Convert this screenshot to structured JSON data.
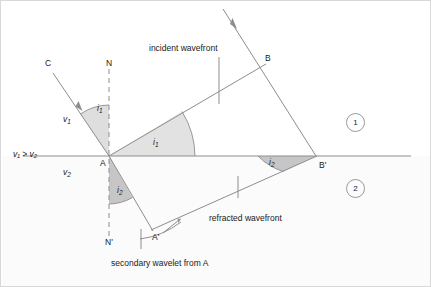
{
  "figure": {
    "background_color": "#ffffff",
    "line_color": "#8d8d8d",
    "text_color": "#1a1a1a",
    "shade_color": "#d9d9d9",
    "dark_shade_color": "#bdbdbd"
  },
  "labels": {
    "point_c": "C",
    "point_n": "N",
    "point_b": "B",
    "point_a": "A",
    "point_b_prime": "B'",
    "point_a_prime": "A'",
    "point_n_prime": "N'",
    "speed_1": "v",
    "speed_1_sub": "1",
    "speed_2": "v",
    "speed_2_sub": "2",
    "speed_relation": "v₁ > v₂",
    "angle_i1": "i",
    "angle_i1_sub": "1",
    "angle_i2": "i",
    "angle_i2_sub": "2",
    "incident_wavefront": "incident wavefront",
    "refracted_wavefront": "refracted wavefront",
    "secondary_wavelet": "secondary wavelet from A",
    "region_1": "1",
    "region_2": "2"
  },
  "geometry": {
    "interface_y": 155,
    "point_a": [
      108,
      155
    ],
    "point_b": [
      262,
      65
    ],
    "point_b_prime": [
      315,
      155
    ],
    "point_a_prime": [
      150,
      228
    ],
    "point_c": [
      52,
      70
    ],
    "normal_top": [
      108,
      68
    ],
    "normal_bottom": [
      108,
      237
    ],
    "incident_ray_start": [
      222,
      8
    ],
    "wavelet_radius": 73
  },
  "annotations": {
    "incident_leader": {
      "from": [
        218,
        55
      ],
      "to": [
        218,
        105
      ]
    },
    "refracted_leader": {
      "from": [
        237,
        198
      ],
      "to": [
        237,
        175
      ]
    },
    "wavelet_leader": {
      "from": [
        140,
        248
      ],
      "to": [
        140,
        228
      ]
    }
  }
}
